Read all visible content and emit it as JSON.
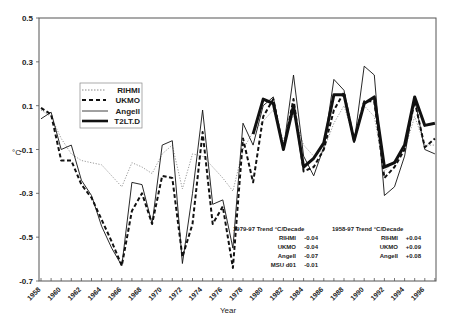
{
  "chart_data": {
    "type": "line",
    "title": "",
    "xlabel": "Year",
    "ylabel": "°C",
    "ylim": [
      -0.7,
      0.5
    ],
    "xlim": [
      1958,
      1997
    ],
    "grid": false,
    "legend_position": "upper-left-inset",
    "y_ticks": [
      "0.5",
      "0.3",
      "0.1",
      "-0.1",
      "-0.3",
      "-0.5",
      "-0.7"
    ],
    "x_ticks": [
      "1958",
      "1960",
      "1962",
      "1964",
      "1966",
      "1968",
      "1970",
      "1972",
      "1974",
      "1976",
      "1978",
      "1980",
      "1982",
      "1984",
      "1986",
      "1988",
      "1990",
      "1992",
      "1994",
      "1996"
    ],
    "x": [
      1958,
      1959,
      1960,
      1961,
      1962,
      1963,
      1964,
      1965,
      1966,
      1967,
      1968,
      1969,
      1970,
      1971,
      1972,
      1973,
      1974,
      1975,
      1976,
      1977,
      1978,
      1979,
      1980,
      1981,
      1982,
      1983,
      1984,
      1985,
      1986,
      1987,
      1988,
      1989,
      1990,
      1991,
      1992,
      1993,
      1994,
      1995,
      1996,
      1997
    ],
    "series": [
      {
        "name": "RIHMI",
        "style": "dotted",
        "values": [
          0.08,
          0.05,
          -0.05,
          -0.12,
          -0.15,
          -0.16,
          -0.17,
          -0.22,
          -0.27,
          -0.16,
          -0.18,
          -0.21,
          -0.12,
          -0.08,
          -0.28,
          -0.12,
          -0.13,
          -0.18,
          -0.23,
          -0.29,
          -0.1,
          -0.02,
          0.03,
          0.08,
          -0.06,
          0.06,
          -0.08,
          -0.13,
          -0.1,
          0.02,
          0.1,
          -0.05,
          0.1,
          0.05,
          -0.2,
          -0.15,
          -0.1,
          0.05,
          -0.08,
          -0.08
        ]
      },
      {
        "name": "UKMO",
        "style": "dashed",
        "values": [
          0.09,
          0.06,
          -0.15,
          -0.15,
          -0.26,
          -0.32,
          -0.42,
          -0.52,
          -0.63,
          -0.38,
          -0.3,
          -0.44,
          -0.22,
          -0.23,
          -0.59,
          -0.44,
          -0.02,
          -0.44,
          -0.36,
          -0.64,
          -0.05,
          -0.25,
          0.05,
          0.13,
          -0.1,
          0.13,
          -0.2,
          -0.18,
          -0.1,
          0.08,
          0.16,
          -0.06,
          0.12,
          0.12,
          -0.23,
          -0.18,
          -0.1,
          0.12,
          -0.09,
          -0.05
        ]
      },
      {
        "name": "Angell",
        "style": "solid-thin",
        "values": [
          0.04,
          0.07,
          -0.1,
          -0.08,
          -0.24,
          -0.31,
          -0.45,
          -0.55,
          -0.63,
          -0.25,
          -0.26,
          -0.44,
          -0.08,
          -0.06,
          -0.62,
          -0.3,
          0.08,
          -0.35,
          -0.33,
          -0.55,
          0.02,
          -0.08,
          0.1,
          0.14,
          -0.1,
          0.24,
          -0.13,
          -0.22,
          -0.09,
          0.22,
          0.17,
          -0.07,
          0.28,
          0.24,
          -0.31,
          -0.27,
          -0.13,
          0.13,
          -0.1,
          -0.12
        ]
      },
      {
        "name": "T2LT.D",
        "style": "solid-thick",
        "values": [
          null,
          null,
          null,
          null,
          null,
          null,
          null,
          null,
          null,
          null,
          null,
          null,
          null,
          null,
          null,
          null,
          null,
          null,
          null,
          null,
          null,
          -0.03,
          0.13,
          0.11,
          -0.1,
          0.1,
          -0.18,
          -0.14,
          -0.07,
          0.15,
          0.15,
          -0.06,
          0.11,
          0.14,
          -0.18,
          -0.16,
          -0.08,
          0.14,
          0.01,
          0.02
        ]
      }
    ],
    "legend": [
      "RIHMI",
      "UKMO",
      "Angell",
      "T2LT.D"
    ],
    "annotations": [
      {
        "header": "1979-97  Trend  °C/Decade",
        "rows": [
          {
            "label": "RIHMI",
            "value": "-0.04"
          },
          {
            "label": "UKMO",
            "value": "-0.04"
          },
          {
            "label": "Angell",
            "value": "-0.07"
          },
          {
            "label": "MSU d01",
            "value": "-0.01"
          }
        ]
      },
      {
        "header": "1958-97  Trend  °C/Decade",
        "rows": [
          {
            "label": "RIHMI",
            "value": "+0.04"
          },
          {
            "label": "UKMO",
            "value": "+0.09"
          },
          {
            "label": "Angell",
            "value": "+0.08"
          }
        ]
      }
    ]
  },
  "colors": {
    "line": "#111111",
    "dotted": "#888888",
    "frame": "#555555"
  }
}
